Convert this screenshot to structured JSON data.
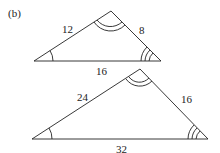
{
  "figure_label": "(b)",
  "triangles": [
    {
      "name": "small",
      "sides": {
        "left": "12",
        "right": "8",
        "base": "16"
      }
    },
    {
      "name": "large",
      "sides": {
        "left": "24",
        "right": "16",
        "base": "32"
      }
    }
  ],
  "colors": {
    "stroke": "#222222",
    "background": "#ffffff"
  }
}
